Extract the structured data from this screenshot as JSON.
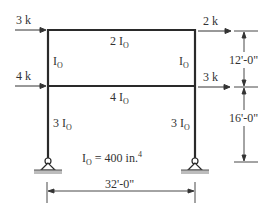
{
  "diagram": {
    "type": "portal-frame",
    "loads": [
      {
        "id": "load-top-left",
        "label": "3 k",
        "level": "roof",
        "side": "left"
      },
      {
        "id": "load-top-right",
        "label": "2 k",
        "level": "roof",
        "side": "right"
      },
      {
        "id": "load-mid-left",
        "label": "4 k",
        "level": "floor",
        "side": "left"
      },
      {
        "id": "load-mid-right",
        "label": "3 k",
        "level": "floor",
        "side": "right"
      }
    ],
    "members": {
      "top_beam": {
        "coef": "2",
        "symbol": "I",
        "sub": "O"
      },
      "mid_beam": {
        "coef": "4",
        "symbol": "I",
        "sub": "O"
      },
      "upper_left_col": {
        "coef": "",
        "symbol": "I",
        "sub": "O"
      },
      "upper_right_col": {
        "coef": "",
        "symbol": "I",
        "sub": "O"
      },
      "lower_left_col": {
        "coef": "3",
        "symbol": "I",
        "sub": "O"
      },
      "lower_right_col": {
        "coef": "3",
        "symbol": "I",
        "sub": "O"
      }
    },
    "property": {
      "symbol": "I",
      "sub": "O",
      "eq": " = 400 in.",
      "sup": "4"
    },
    "dimensions": {
      "upper_height": "12'-0\"",
      "lower_height": "16'-0\"",
      "span": "32'-0\""
    },
    "colors": {
      "line": "#2a2a2a",
      "ground": "#bdbdbd"
    }
  }
}
